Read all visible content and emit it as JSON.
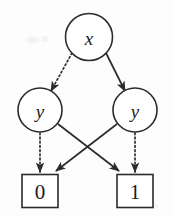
{
  "diagram": {
    "type": "directed-graph",
    "width": 173,
    "height": 217,
    "background_color": "#fdfdfd",
    "stroke_color": "#2b2b2b",
    "label_color": "#1a1a1a",
    "nodes": [
      {
        "id": "x-root",
        "label": "x",
        "shape": "circle",
        "style": "italic",
        "cx": 89,
        "cy": 37,
        "r": 23.5
      },
      {
        "id": "y-left",
        "label": "y",
        "shape": "circle",
        "style": "italic",
        "cx": 40,
        "cy": 110,
        "r": 22
      },
      {
        "id": "y-right",
        "label": "y",
        "shape": "circle",
        "style": "italic",
        "cx": 135,
        "cy": 110,
        "r": 22
      },
      {
        "id": "leaf-zero",
        "label": "0",
        "shape": "square",
        "style": "normal",
        "cx": 40,
        "cy": 191,
        "w": 36,
        "h": 33
      },
      {
        "id": "leaf-one",
        "label": "1",
        "shape": "square",
        "style": "normal",
        "cx": 135,
        "cy": 191,
        "w": 36,
        "h": 33
      }
    ],
    "edges": [
      {
        "id": "edge-x-to-y-left",
        "from": "x-root",
        "to": "y-left",
        "line": "dotted",
        "arrow": true
      },
      {
        "id": "edge-x-to-y-right",
        "from": "x-root",
        "to": "y-right",
        "line": "solid",
        "arrow": true
      },
      {
        "id": "edge-y-left-to-zero",
        "from": "y-left",
        "to": "leaf-zero",
        "line": "dotted",
        "arrow": true
      },
      {
        "id": "edge-y-left-to-one",
        "from": "y-left",
        "to": "leaf-one",
        "line": "solid",
        "arrow": true
      },
      {
        "id": "edge-y-right-to-zero",
        "from": "y-right",
        "to": "leaf-zero",
        "line": "solid",
        "arrow": true
      },
      {
        "id": "edge-y-right-to-one",
        "from": "y-right",
        "to": "leaf-one",
        "line": "dotted",
        "arrow": true
      }
    ]
  }
}
